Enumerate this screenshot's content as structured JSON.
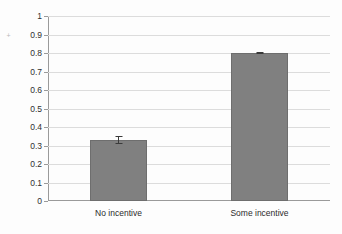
{
  "chart_data": {
    "type": "bar",
    "title": "",
    "xlabel": "",
    "ylabel": "Percent learning HIV results",
    "categories": [
      "No incentive",
      "Some incentive"
    ],
    "values": [
      0.33,
      0.8
    ],
    "errors": [
      0.02,
      0.008
    ],
    "ylim": [
      0,
      1
    ],
    "ytick_labels": [
      "0",
      "0.1",
      "0.2",
      "0.3",
      "0.4",
      "0.5",
      "0.6",
      "0.7",
      "0.8",
      "0.9",
      "1"
    ],
    "ytick_values": [
      0,
      0.1,
      0.2,
      0.3,
      0.4,
      0.5,
      0.6,
      0.7,
      0.8,
      0.9,
      1
    ],
    "grid": true,
    "legend": "none",
    "series": [
      {
        "name": "Percent learning HIV results",
        "values": [
          0.33,
          0.8
        ],
        "errors": [
          0.02,
          0.008
        ],
        "color": "#808080"
      }
    ],
    "colors": {
      "bar_fill": "#808080",
      "bar_border": "#6e6e6e",
      "gridline": "#dcdcdc",
      "axis": "#9a9a9a",
      "error_bar": "#3a3a3a",
      "background": "#fdfdfd",
      "text": "#2b2b2b"
    }
  }
}
